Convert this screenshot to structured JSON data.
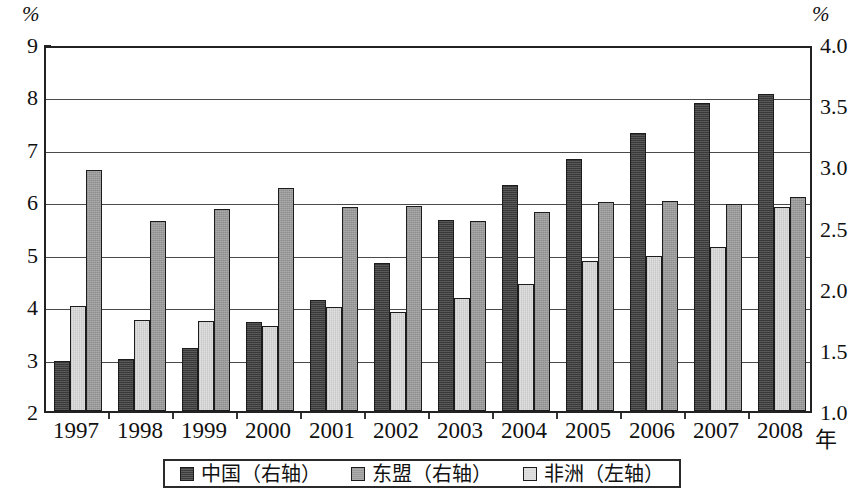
{
  "axes": {
    "left_unit": "%",
    "right_unit": "%",
    "x_unit": "年",
    "left_ticks": [
      "9",
      "8",
      "7",
      "6",
      "5",
      "4",
      "3",
      "2"
    ],
    "right_ticks": [
      "4.0",
      "3.5",
      "3.0",
      "2.5",
      "2.0",
      "1.5",
      "1.0"
    ]
  },
  "legend": {
    "items": [
      {
        "label": "中国（右轴）",
        "color": "#3b3b3b",
        "swatch": "china-swatch"
      },
      {
        "label": "东盟（右轴）",
        "color": "#9a9a9a",
        "swatch": "asean-swatch"
      },
      {
        "label": "非洲（左轴）",
        "color": "#d9d9d9",
        "swatch": "africa-swatch"
      }
    ]
  },
  "chart_data": {
    "type": "bar",
    "title": "",
    "subtitle": "",
    "xlabel": "年",
    "ylabel": "%",
    "y2label": "%",
    "grid": true,
    "legend_position": "bottom",
    "categories": [
      "1997",
      "1998",
      "1999",
      "2000",
      "2001",
      "2002",
      "2003",
      "2004",
      "2005",
      "2006",
      "2007",
      "2008"
    ],
    "ylim": [
      2,
      9
    ],
    "y2lim": [
      1.0,
      4.0
    ],
    "left_tick_values": [
      2,
      3,
      4,
      5,
      6,
      7,
      8,
      9
    ],
    "right_tick_values": [
      1.0,
      1.5,
      2.0,
      2.5,
      3.0,
      3.5,
      4.0
    ],
    "series": [
      {
        "name": "中国（右轴）",
        "axis": "right",
        "color": "#3b3b3b",
        "values": [
          1.41,
          1.43,
          1.52,
          1.73,
          1.91,
          2.21,
          2.56,
          2.85,
          3.06,
          3.28,
          3.52,
          3.59
        ],
        "left_scale_tops": [
          2.95,
          2.99,
          3.21,
          3.7,
          4.12,
          4.82,
          5.65,
          6.32,
          6.8,
          7.31,
          7.88,
          8.05
        ]
      },
      {
        "name": "东盟（右轴）",
        "axis": "right",
        "color": "#9a9a9a",
        "values": [
          2.94,
          2.51,
          2.65,
          2.82,
          2.67,
          2.67,
          2.55,
          2.62,
          2.71,
          2.72,
          2.7,
          2.74
        ],
        "left_scale_tops": [
          6.6,
          5.62,
          5.86,
          6.25,
          5.9,
          5.91,
          5.63,
          5.8,
          5.99,
          6.01,
          5.94,
          6.08
        ]
      },
      {
        "name": "非洲（左轴）",
        "axis": "left",
        "color": "#d9d9d9",
        "values": [
          4.0,
          3.74,
          3.71,
          3.62,
          3.99,
          3.88,
          4.16,
          4.42,
          4.86,
          4.95,
          5.13,
          5.9
        ]
      }
    ]
  }
}
